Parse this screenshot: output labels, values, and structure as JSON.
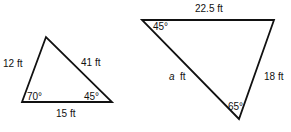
{
  "triangles": [
    {
      "sides": {
        "left": "12 ft",
        "right": "41 ft",
        "bottom": "15 ft"
      },
      "angles": {
        "bottom_left": "70°",
        "bottom_right": "45°"
      }
    },
    {
      "sides": {
        "top": "22.5 ft",
        "right": "18 ft",
        "left_var": "a",
        "left_unit": "ft"
      },
      "angles": {
        "top_left": "45°",
        "bottom": "65°"
      }
    }
  ]
}
